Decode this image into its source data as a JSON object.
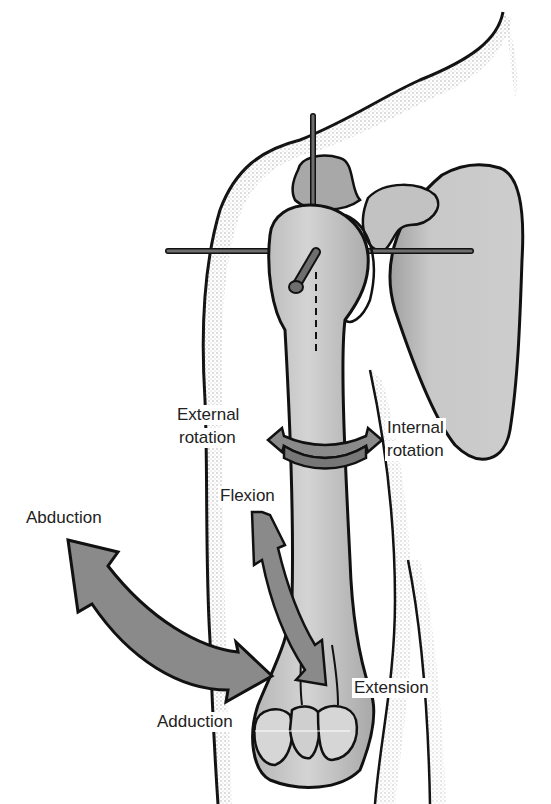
{
  "figure": {
    "colors": {
      "background": "#ffffff",
      "outline": "#111111",
      "bone": "#c9c9c9",
      "bone_shadow": "#9a9a9a",
      "arrow": "#8a8a8a",
      "axis_rod": "#6e6e6e",
      "skin_stipple": "#555555",
      "text": "#222222"
    },
    "labels": {
      "external_rotation_line1": "External",
      "external_rotation_line2": "rotation",
      "internal_rotation_line1": "Internal",
      "internal_rotation_line2": "rotation",
      "flexion": "Flexion",
      "abduction": "Abduction",
      "extension": "Extension",
      "adduction": "Adduction"
    },
    "structures": [
      "humerus",
      "scapula",
      "clavicle/acromion",
      "axis rods",
      "body outline"
    ],
    "motions": [
      "external-rotation",
      "internal-rotation",
      "flexion",
      "extension",
      "abduction",
      "adduction"
    ]
  }
}
